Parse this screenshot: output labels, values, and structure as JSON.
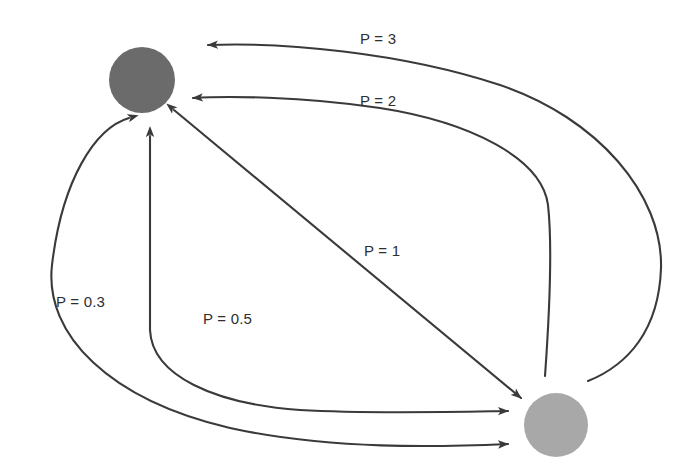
{
  "diagram": {
    "type": "directed-graph",
    "background_color": "#ffffff",
    "stroke_color": "#3a3a3a",
    "nodes": [
      {
        "id": "node-a",
        "name": "top-left-node",
        "color": "#6b6b6b",
        "cx": 142,
        "cy": 80,
        "r": 33
      },
      {
        "id": "node-b",
        "name": "bottom-right-node",
        "color": "#a8a8a8",
        "cx": 556,
        "cy": 425,
        "r": 32
      }
    ],
    "edges": [
      {
        "id": "edge-p3",
        "label": "P = 3",
        "value": 3,
        "from": "node-b",
        "to": "node-a",
        "arrowheads": "end",
        "label_x": 360,
        "label_y": 30
      },
      {
        "id": "edge-p2",
        "label": "P = 2",
        "value": 2,
        "from": "node-b",
        "to": "node-a",
        "arrowheads": "end",
        "label_x": 360,
        "label_y": 92
      },
      {
        "id": "edge-p1",
        "label": "P = 1",
        "value": 1,
        "from": "node-a",
        "to": "node-b",
        "arrowheads": "both",
        "label_x": 364,
        "label_y": 242
      },
      {
        "id": "edge-p05",
        "label": "P = 0.5",
        "value": 0.5,
        "from": "node-a",
        "to": "node-b",
        "arrowheads": "both",
        "label_x": 203,
        "label_y": 310
      },
      {
        "id": "edge-p03",
        "label": "P = 0.3",
        "value": 0.3,
        "from": "node-a",
        "to": "node-b",
        "arrowheads": "both",
        "label_x": 56,
        "label_y": 293
      }
    ]
  }
}
